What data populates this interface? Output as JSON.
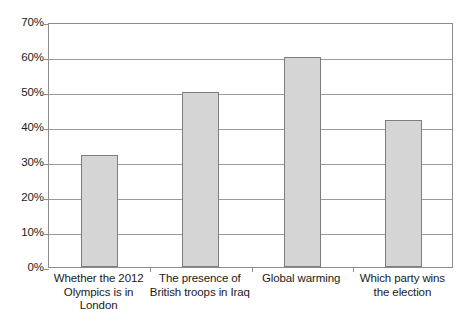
{
  "chart_data": {
    "type": "bar",
    "title": "",
    "subtitle": "",
    "xlabel": "",
    "ylabel": "",
    "categories": [
      "Whether the 2012 Olympics is in London",
      "The presence of British troops in Iraq",
      "Global warming",
      "Which party wins the election"
    ],
    "category_lines": [
      [
        "Whether the 2012",
        "Olympics is in",
        "London"
      ],
      [
        "The presence of",
        "British troops in Iraq"
      ],
      [
        "Global warming"
      ],
      [
        "Which party wins",
        "the election"
      ]
    ],
    "values": [
      32,
      50,
      60,
      42
    ],
    "value_labels": [
      "32%",
      "50%",
      "60%",
      "42%"
    ],
    "ylim": [
      0,
      70
    ],
    "ytick_values": [
      0,
      10,
      20,
      30,
      40,
      50,
      60,
      70
    ],
    "ytick_labels": [
      "0%",
      "10%",
      "20%",
      "30%",
      "40%",
      "50%",
      "60%",
      "70%"
    ],
    "grid": true,
    "legend": false,
    "legend_position": "none",
    "bar_fill_color": "#d5d5d5",
    "bar_border_color": "#7d7d7d",
    "gridline_color": "#9a9a9a",
    "axis_color": "#8c8c8c",
    "background_color": "#ffffff"
  }
}
